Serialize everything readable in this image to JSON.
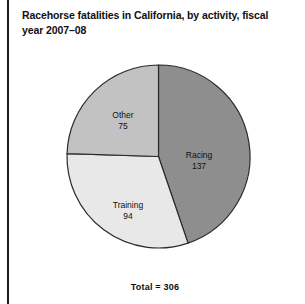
{
  "figure": {
    "title": "Racehorse fatalities in California, by activity, fiscal year 2007–08",
    "total_label": "Total = 306",
    "background_color": "#ffffff",
    "rule_color": "#1a1a1a"
  },
  "chart_data": {
    "type": "pie",
    "title": "Racehorse fatalities in California, by activity, fiscal year 2007–08",
    "categories": [
      "Racing",
      "Training",
      "Other"
    ],
    "values": [
      137,
      94,
      75
    ],
    "total": 306,
    "units": "fatalities",
    "start_angle_deg": 0,
    "direction": "clockwise",
    "legend": "none",
    "labels_inside": true,
    "slices": [
      {
        "label": "Racing",
        "value": 137,
        "value_text": "137",
        "percent": 44.8,
        "angle_deg": 161.2,
        "color": "#8e8e8e",
        "stroke": "#2b2b2b"
      },
      {
        "label": "Training",
        "value": 94,
        "value_text": "94",
        "percent": 30.7,
        "angle_deg": 110.6,
        "color": "#e8e8e8",
        "stroke": "#2b2b2b"
      },
      {
        "label": "Other",
        "value": 75,
        "value_text": "75",
        "percent": 24.5,
        "angle_deg": 88.2,
        "color": "#c2c2c2",
        "stroke": "#2b2b2b"
      }
    ]
  }
}
